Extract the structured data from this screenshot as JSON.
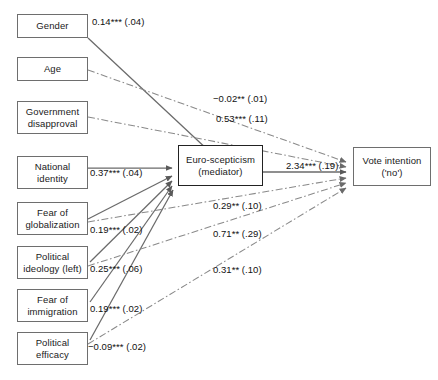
{
  "figure": {
    "type": "path-diagram",
    "background_color": "#ffffff",
    "line_color": "#7a7a7a",
    "text_color": "#111111",
    "box_border_color": "#6e6e6e"
  },
  "nodes": {
    "predictors": [
      {
        "id": "gender",
        "label": "Gender",
        "x": 17,
        "y": 14,
        "w": 71,
        "h": 24
      },
      {
        "id": "age",
        "label": "Age",
        "x": 17,
        "y": 57,
        "w": 71,
        "h": 24
      },
      {
        "id": "government-disapproval",
        "label": "Government\ndisapproval",
        "x": 17,
        "y": 101,
        "w": 71,
        "h": 33
      },
      {
        "id": "national-identity",
        "label": "National\nidentity",
        "x": 17,
        "y": 156,
        "w": 71,
        "h": 33
      },
      {
        "id": "fear-of-globalization",
        "label": "Fear of\nglobalization",
        "x": 17,
        "y": 202,
        "w": 71,
        "h": 33
      },
      {
        "id": "political-ideology-left",
        "label": "Political\nideology (left)",
        "x": 17,
        "y": 246,
        "w": 71,
        "h": 33
      },
      {
        "id": "fear-of-immigration",
        "label": "Fear of\nimmigration",
        "x": 17,
        "y": 289,
        "w": 71,
        "h": 33
      },
      {
        "id": "political-efficacy",
        "label": "Political\nefficacy",
        "x": 17,
        "y": 332,
        "w": 71,
        "h": 33
      }
    ],
    "mediator": {
      "id": "euro-scepticism",
      "label": "Euro-scepticism\n(mediator)",
      "x": 178,
      "y": 145,
      "w": 85,
      "h": 41
    },
    "outcome": {
      "id": "vote-intention",
      "label": "Vote intention\n('no')",
      "x": 353,
      "y": 147,
      "w": 78,
      "h": 39
    }
  },
  "coefficients": [
    {
      "id": "gender-to-mediator",
      "text": "0.14*** (.04)",
      "x": 92,
      "y": 16,
      "from": "gender",
      "to": "euro-scepticism",
      "style": "solid"
    },
    {
      "id": "age-to-outcome",
      "text": "−0.02** (.01)",
      "x": 213,
      "y": 93,
      "from": "age",
      "to": "vote-intention",
      "style": "dash-dot"
    },
    {
      "id": "govdisapproval-to-outcome",
      "text": "0.53*** (.11)",
      "x": 216,
      "y": 113,
      "from": "government-disapproval",
      "to": "vote-intention",
      "style": "dash-dot"
    },
    {
      "id": "nationalidentity-to-mediator",
      "text": "0.37*** (.04)",
      "x": 90,
      "y": 167,
      "from": "national-identity",
      "to": "euro-scepticism",
      "style": "solid"
    },
    {
      "id": "mediator-to-outcome",
      "text": "2.34*** (.19)",
      "x": 286,
      "y": 160,
      "from": "euro-scepticism",
      "to": "vote-intention",
      "style": "solid"
    },
    {
      "id": "fearglobalization-to-mediator",
      "text": "0.19*** (.02)",
      "x": 90,
      "y": 224,
      "from": "fear-of-globalization",
      "to": "euro-scepticism",
      "style": "solid"
    },
    {
      "id": "fearglobalization-to-outcome",
      "text": "0.29** (.10)",
      "x": 213,
      "y": 200,
      "from": "fear-of-globalization",
      "to": "vote-intention",
      "style": "dash-dot"
    },
    {
      "id": "politicalideology-to-mediator",
      "text": "0.25*** (.06)",
      "x": 90,
      "y": 263,
      "from": "political-ideology-left",
      "to": "euro-scepticism",
      "style": "solid"
    },
    {
      "id": "politicalideology-to-outcome",
      "text": "0.71** (.29)",
      "x": 213,
      "y": 228,
      "from": "political-ideology-left",
      "to": "vote-intention",
      "style": "dash-dot"
    },
    {
      "id": "fearimmigration-to-mediator",
      "text": "0.19*** (.02)",
      "x": 90,
      "y": 303,
      "from": "fear-of-immigration",
      "to": "euro-scepticism",
      "style": "solid"
    },
    {
      "id": "politicalefficacy-to-mediator",
      "text": "−0.09*** (.02)",
      "x": 88,
      "y": 341,
      "from": "political-efficacy",
      "to": "euro-scepticism",
      "style": "solid"
    },
    {
      "id": "politicalefficacy-to-outcome",
      "text": "0.31** (.10)",
      "x": 213,
      "y": 264,
      "from": "political-efficacy",
      "to": "vote-intention",
      "style": "dash-dot"
    }
  ]
}
